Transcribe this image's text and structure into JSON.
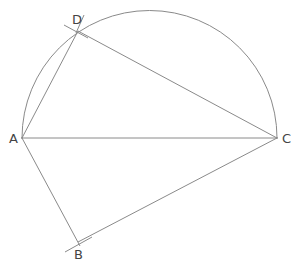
{
  "diagram": {
    "type": "geometry-construction",
    "stroke_color": "#8a8a8a",
    "label_color": "#444444",
    "points": {
      "A": {
        "label": "A",
        "x": 22,
        "y": 138
      },
      "B": {
        "label": "B",
        "x": 78,
        "y": 242
      },
      "C": {
        "label": "C",
        "x": 277,
        "y": 138
      },
      "D": {
        "label": "D",
        "x": 78,
        "y": 31
      }
    },
    "circle": {
      "center": [
        149.5,
        138
      ],
      "radius": 127.5,
      "arc": "upper semicircle over AC"
    },
    "segments": [
      "AC",
      "AD",
      "DC",
      "AB",
      "BC"
    ]
  }
}
